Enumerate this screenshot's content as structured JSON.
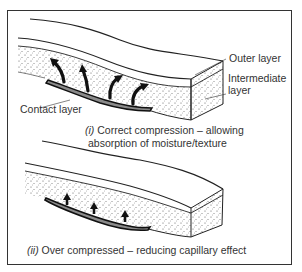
{
  "figure": {
    "panels": [
      {
        "id": "correct",
        "caption_numeral": "(i)",
        "caption_line1": "Correct compression – allowing",
        "caption_line2": "absorption of moisture/texture",
        "arrow_count": 4,
        "arrow_style": "curved"
      },
      {
        "id": "over",
        "caption_numeral": "(ii)",
        "caption_line1": "Over compressed – reducing capillary effect",
        "arrow_count": 3,
        "arrow_style": "short-straight"
      }
    ],
    "labels": {
      "outer": "Outer layer",
      "intermediate_line1": "Intermediate",
      "intermediate_line2": "layer",
      "contact": "Contact layer"
    },
    "colors": {
      "line": "#222222",
      "contact_fill": "#8a8a8a",
      "arrow": "#111111",
      "border": "#333333",
      "dots": "#555555"
    }
  }
}
